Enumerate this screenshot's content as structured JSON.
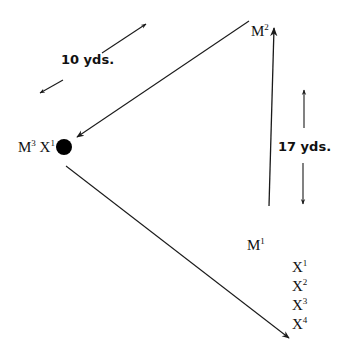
{
  "diagram": {
    "colors": {
      "line": "#1a1a1a",
      "background": "#ffffff"
    },
    "nodes": {
      "m2": {
        "base": "M",
        "sup": "2"
      },
      "m1": {
        "base": "M",
        "sup": "1"
      },
      "m3x1": {
        "base1": "M",
        "sup1": "3",
        "base2": "X",
        "sup2": "1"
      }
    },
    "distances": {
      "top": "10 yds.",
      "right": "17 yds."
    },
    "x_list": [
      {
        "base": "X",
        "sup": "1"
      },
      {
        "base": "X",
        "sup": "2"
      },
      {
        "base": "X",
        "sup": "3"
      },
      {
        "base": "X",
        "sup": "4"
      }
    ],
    "marker": {
      "shape": "filled-circle",
      "color": "#000000"
    }
  }
}
